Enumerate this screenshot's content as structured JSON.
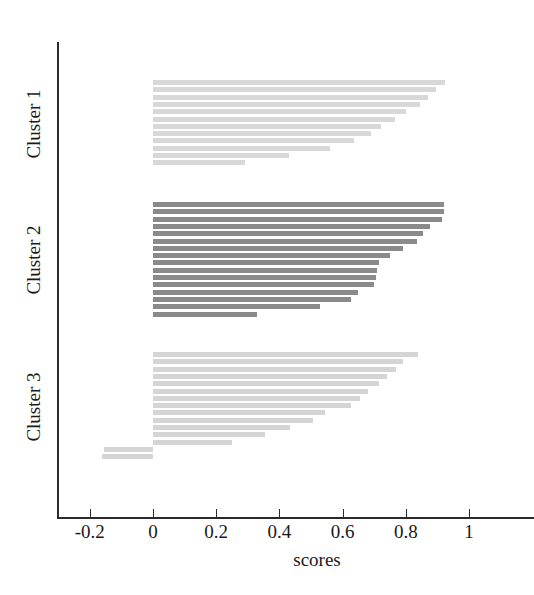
{
  "figure": {
    "background": "#ffffff",
    "axis_color": "#2a2a2a"
  },
  "axis": {
    "x_title": "scores",
    "x_ticks": [
      "-0.2",
      "0",
      "0.2",
      "0.4",
      "0.6",
      "0.8",
      "1"
    ],
    "x_tick_values": [
      -0.2,
      0,
      0.2,
      0.4,
      0.6,
      0.8,
      1
    ],
    "y_labels": [
      "Cluster 1",
      "Cluster 2",
      "Cluster 3"
    ]
  },
  "chart_data": {
    "type": "bar",
    "orientation": "horizontal",
    "title": "",
    "xlabel": "scores",
    "ylabel": "",
    "xlim": [
      -0.28,
      1.12
    ],
    "grid": false,
    "legend": "none",
    "series": [
      {
        "name": "Cluster 1",
        "color": "#d8d8d8",
        "count": 12,
        "values": [
          0.925,
          0.895,
          0.87,
          0.845,
          0.8,
          0.765,
          0.72,
          0.69,
          0.635,
          0.56,
          0.43,
          0.29
        ]
      },
      {
        "name": "Cluster 2",
        "color": "#8a8a8a",
        "count": 16,
        "values": [
          0.92,
          0.92,
          0.915,
          0.875,
          0.855,
          0.835,
          0.79,
          0.75,
          0.715,
          0.71,
          0.705,
          0.7,
          0.65,
          0.625,
          0.53,
          0.33
        ]
      },
      {
        "name": "Cluster 3",
        "color": "#d5d5d5",
        "count": 15,
        "values": [
          0.84,
          0.79,
          0.77,
          0.74,
          0.715,
          0.68,
          0.655,
          0.625,
          0.545,
          0.505,
          0.435,
          0.355,
          0.25,
          -0.155,
          -0.16
        ]
      }
    ]
  },
  "geometry": {
    "x0_px": 153,
    "px_per_unit": 316,
    "bar_height_px": 5,
    "cluster_starts_y": [
      80,
      202,
      352
    ],
    "row_pitch_px": 7.3
  }
}
